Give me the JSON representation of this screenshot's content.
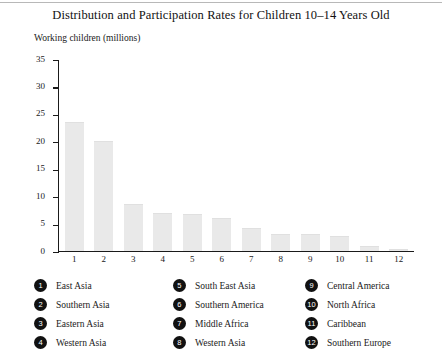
{
  "chart_data": {
    "type": "bar",
    "title": "Distribution and Participation Rates for Children 10–14 Years Old",
    "ylabel": "Working children (millions)",
    "xlabel": "",
    "categories": [
      "1",
      "2",
      "3",
      "4",
      "5",
      "6",
      "7",
      "8",
      "9",
      "10",
      "11",
      "12"
    ],
    "values": [
      23.5,
      20.0,
      8.3,
      6.8,
      6.5,
      5.8,
      3.9,
      2.8,
      2.8,
      2.5,
      0.7,
      0.15
    ],
    "ylim": [
      0,
      35
    ],
    "yticks": [
      0,
      5,
      10,
      15,
      20,
      25,
      30,
      35
    ],
    "ytick_labels": [
      "0",
      "5",
      "10",
      "15",
      "20",
      "25",
      "30",
      "35"
    ],
    "grid": false,
    "legend_position": "below",
    "bar_color": "#e9e9e9",
    "axis_color": "#1a1a1a",
    "legend": [
      {
        "number": "1",
        "label": "East Asia"
      },
      {
        "number": "2",
        "label": "Southern Asia"
      },
      {
        "number": "3",
        "label": "Eastern Asia"
      },
      {
        "number": "4",
        "label": "Western Asia"
      },
      {
        "number": "5",
        "label": "South East Asia"
      },
      {
        "number": "6",
        "label": "Southern America"
      },
      {
        "number": "7",
        "label": "Middle Africa"
      },
      {
        "number": "8",
        "label": "Western Asia"
      },
      {
        "number": "9",
        "label": "Central America"
      },
      {
        "number": "10",
        "label": "North Africa"
      },
      {
        "number": "11",
        "label": "Caribbean"
      },
      {
        "number": "12",
        "label": "Southern Europe"
      }
    ]
  }
}
